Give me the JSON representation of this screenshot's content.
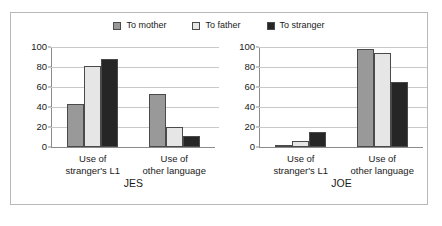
{
  "chart_data": {
    "type": "bar",
    "title": "",
    "xlabel": "",
    "ylabel": "",
    "ylim": [
      0,
      100
    ],
    "yticks": [
      0,
      20,
      40,
      60,
      80,
      100
    ],
    "grid": true,
    "legend_position": "top-center",
    "legend": [
      "To mother",
      "To father",
      "To stranger"
    ],
    "categories": [
      "Use of stranger's L1",
      "Use of other language"
    ],
    "category_lines": [
      [
        "Use of",
        "stranger's L1"
      ],
      [
        "Use of",
        "other language"
      ]
    ],
    "panels": [
      {
        "name": "JES",
        "series": [
          {
            "name": "To mother",
            "values": [
              43,
              53
            ]
          },
          {
            "name": "To father",
            "values": [
              81,
              20
            ]
          },
          {
            "name": "To stranger",
            "values": [
              88,
              11
            ]
          }
        ]
      },
      {
        "name": "JOE",
        "series": [
          {
            "name": "To mother",
            "values": [
              2,
              98
            ]
          },
          {
            "name": "To father",
            "values": [
              6,
              94
            ]
          },
          {
            "name": "To stranger",
            "values": [
              15,
              65
            ]
          }
        ]
      }
    ],
    "colors": {
      "to_mother": "#999999",
      "to_father": "#e6e6e6",
      "to_stranger": "#262626",
      "bar_border": "#4a4a4a",
      "gridline": "#c9c9c9",
      "axis": "#8a8a8a",
      "frame": "#b8b8b8",
      "background": "#ffffff",
      "text": "#1a1a1a"
    }
  }
}
